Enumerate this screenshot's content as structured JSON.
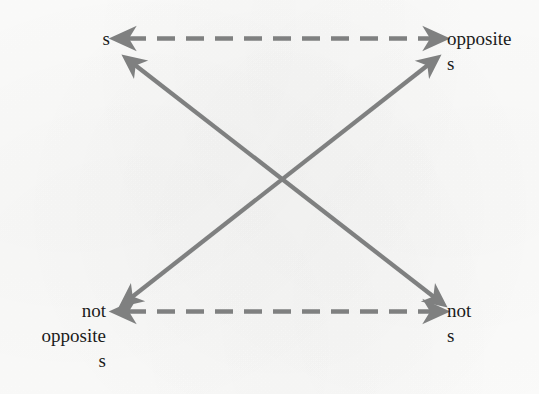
{
  "diagram": {
    "type": "square-of-opposition",
    "title_visible": false,
    "background_color": "#fdfdfc",
    "line_color": "#7f8080",
    "text_color": "#1b1b1b",
    "nodes": [
      {
        "id": "top-left",
        "label": "s",
        "position": "top-left",
        "align": "right"
      },
      {
        "id": "top-right",
        "label": "opposite\ns",
        "position": "top-right",
        "align": "left"
      },
      {
        "id": "bottom-left",
        "label": "not\nopposite\ns",
        "position": "bottom-left",
        "align": "right"
      },
      {
        "id": "bottom-right",
        "label": "not\ns",
        "position": "bottom-right",
        "align": "left"
      }
    ],
    "edges": [
      {
        "id": "edge-top-horizontal",
        "from": "top-left",
        "to": "top-right",
        "style": "dashed",
        "heads": "both",
        "orientation": "horizontal"
      },
      {
        "id": "edge-bottom-horizontal",
        "from": "bottom-left",
        "to": "bottom-right",
        "style": "dashed",
        "heads": "both",
        "orientation": "horizontal"
      },
      {
        "id": "edge-diagonal-tl-br",
        "from": "top-left",
        "to": "bottom-right",
        "style": "solid",
        "heads": "both",
        "orientation": "diagonal"
      },
      {
        "id": "edge-diagonal-tr-bl",
        "from": "top-right",
        "to": "bottom-left",
        "style": "solid",
        "heads": "both",
        "orientation": "diagonal"
      }
    ]
  }
}
